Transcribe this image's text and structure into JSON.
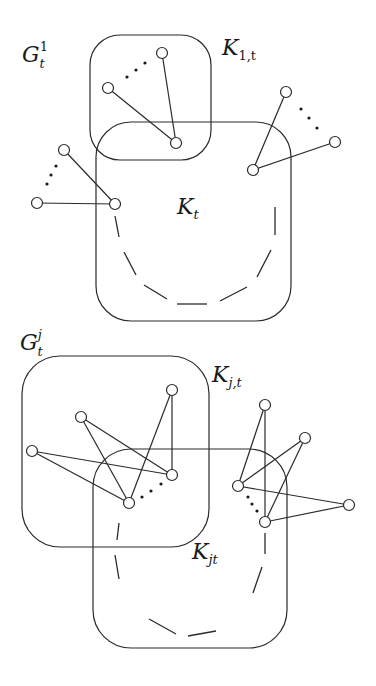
{
  "colors": {
    "stroke": "#2a2a2a",
    "background": "#ffffff"
  },
  "top_diagram": {
    "graph_label": {
      "main": "G",
      "sub": "t",
      "sup": "1"
    },
    "clique_small_label": {
      "main": "K",
      "sub": "1,t"
    },
    "clique_big_label": {
      "main": "K",
      "sub": "t"
    },
    "boxes": [
      {
        "id": "K1t",
        "x": 90,
        "y": 35,
        "w": 121,
        "h": 125,
        "r": 30
      },
      {
        "id": "Kt",
        "x": 96,
        "y": 122,
        "w": 195,
        "h": 199,
        "r": 35
      }
    ],
    "nodes": [
      {
        "id": "a1",
        "x": 162,
        "y": 53
      },
      {
        "id": "a2",
        "x": 108,
        "y": 88
      },
      {
        "id": "a3",
        "x": 176,
        "y": 143
      },
      {
        "id": "b1",
        "x": 64,
        "y": 150
      },
      {
        "id": "b2",
        "x": 37,
        "y": 203
      },
      {
        "id": "b3",
        "x": 115,
        "y": 204
      },
      {
        "id": "c1",
        "x": 286,
        "y": 92
      },
      {
        "id": "c2",
        "x": 335,
        "y": 142
      },
      {
        "id": "c3",
        "x": 253,
        "y": 170
      }
    ],
    "edges": [
      [
        "a1",
        "a3"
      ],
      [
        "a2",
        "a3"
      ],
      [
        "b1",
        "b3"
      ],
      [
        "b2",
        "b3"
      ],
      [
        "c1",
        "c3"
      ],
      [
        "c2",
        "c3"
      ]
    ],
    "dots": [
      [
        127,
        77
      ],
      [
        136,
        70
      ],
      [
        145,
        63
      ],
      [
        56,
        166
      ],
      [
        51,
        175
      ],
      [
        47,
        184
      ],
      [
        301,
        109
      ],
      [
        309,
        118
      ],
      [
        317,
        128
      ]
    ],
    "dashes": [
      [
        115,
        216,
        119,
        237
      ],
      [
        124,
        252,
        136,
        275
      ],
      [
        144,
        285,
        167,
        299
      ],
      [
        177,
        304,
        207,
        304
      ],
      [
        220,
        301,
        247,
        287
      ],
      [
        257,
        277,
        271,
        250
      ],
      [
        275,
        207,
        275,
        235
      ]
    ]
  },
  "bottom_diagram": {
    "graph_label": {
      "main": "G",
      "sub": "t",
      "sup": "j"
    },
    "clique_small_label": {
      "main": "K",
      "sub": "j,t"
    },
    "clique_big_label": {
      "main": "K",
      "sub": "jt"
    },
    "boxes": [
      {
        "id": "Kjt_small",
        "x": 22,
        "y": 356,
        "w": 187,
        "h": 191,
        "r": 38
      },
      {
        "id": "Kjt_big",
        "x": 93,
        "y": 449,
        "w": 194,
        "h": 199,
        "r": 38
      }
    ],
    "nodes": [
      {
        "id": "p1",
        "x": 172,
        "y": 390
      },
      {
        "id": "p2",
        "x": 81,
        "y": 417
      },
      {
        "id": "p3",
        "x": 32,
        "y": 451
      },
      {
        "id": "p4",
        "x": 172,
        "y": 475
      },
      {
        "id": "p5",
        "x": 129,
        "y": 503
      },
      {
        "id": "q1",
        "x": 265,
        "y": 405
      },
      {
        "id": "q2",
        "x": 305,
        "y": 438
      },
      {
        "id": "q3",
        "x": 238,
        "y": 486
      },
      {
        "id": "q4",
        "x": 349,
        "y": 505
      },
      {
        "id": "q5",
        "x": 265,
        "y": 522
      }
    ],
    "edges": [
      [
        "p1",
        "p4"
      ],
      [
        "p1",
        "p5"
      ],
      [
        "p2",
        "p4"
      ],
      [
        "p2",
        "p5"
      ],
      [
        "p3",
        "p4"
      ],
      [
        "p3",
        "p5"
      ],
      [
        "q1",
        "q3"
      ],
      [
        "q1",
        "q5"
      ],
      [
        "q2",
        "q3"
      ],
      [
        "q2",
        "q5"
      ],
      [
        "q4",
        "q3"
      ],
      [
        "q4",
        "q5"
      ]
    ],
    "dots": [
      [
        142,
        497
      ],
      [
        151,
        491
      ],
      [
        161,
        484
      ],
      [
        248,
        497
      ],
      [
        252,
        504
      ],
      [
        257,
        511
      ]
    ],
    "dashes": [
      [
        119,
        523,
        117,
        540
      ],
      [
        115,
        555,
        119,
        579
      ],
      [
        149,
        619,
        176,
        634
      ],
      [
        188,
        636,
        216,
        631
      ],
      [
        253,
        593,
        262,
        567
      ],
      [
        265,
        533,
        265,
        554
      ]
    ]
  }
}
